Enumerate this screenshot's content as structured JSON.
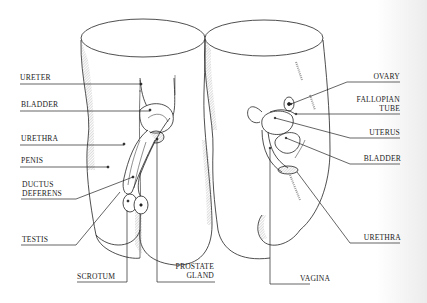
{
  "diagram": {
    "title": "",
    "figures": [
      {
        "id": "male",
        "labels": [
          {
            "key": "ureter",
            "text": "URETER"
          },
          {
            "key": "bladder",
            "text": "BLADDER"
          },
          {
            "key": "urethra",
            "text": "URETHRA"
          },
          {
            "key": "penis",
            "text": "PENIS"
          },
          {
            "key": "ductus_deferens_1",
            "text": "DUCTUS"
          },
          {
            "key": "ductus_deferens_2",
            "text": "DEFERENS"
          },
          {
            "key": "testis",
            "text": "TESTIS"
          },
          {
            "key": "scrotum",
            "text": "SCROTUM"
          },
          {
            "key": "prostate_1",
            "text": "PROSTATE"
          },
          {
            "key": "prostate_2",
            "text": "GLAND"
          }
        ]
      },
      {
        "id": "female",
        "labels": [
          {
            "key": "ovary",
            "text": "OVARY"
          },
          {
            "key": "fallopian_1",
            "text": "FALLOPIAN"
          },
          {
            "key": "fallopian_2",
            "text": "TUBE"
          },
          {
            "key": "uterus",
            "text": "UTERUS"
          },
          {
            "key": "bladder",
            "text": "BLADDER"
          },
          {
            "key": "urethra",
            "text": "URETHRA"
          },
          {
            "key": "vagina",
            "text": "VAGINA"
          }
        ]
      }
    ],
    "colors": {
      "ink": "#1b1b1b",
      "hatch": "#777777",
      "paper": "#ffffff"
    }
  }
}
